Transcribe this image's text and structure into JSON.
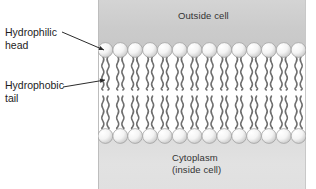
{
  "diagram": {
    "type": "cell-membrane-cross-section",
    "panel": {
      "outside_region_label": "Outside cell",
      "inside_region_label": "Cytoplasm\n(inside cell)",
      "outside_fill": "#cccccc",
      "inside_fill": "#e0e0e0",
      "core_fill": "#ffffff"
    },
    "callouts": [
      {
        "id": "hydrophilic-head",
        "text": "Hydrophilic\nhead",
        "leader_from": [
          62,
          32
        ],
        "leader_to": [
          104,
          50
        ],
        "has_arrowhead": true
      },
      {
        "id": "hydrophobic-tail",
        "text": "Hydrophobic\ntail",
        "leader_from": [
          63,
          87
        ],
        "leader_to": [
          105,
          80
        ],
        "has_arrowhead": true
      }
    ],
    "bilayer": {
      "head_count_per_row": 14,
      "rows": 2,
      "tails_per_head": 2,
      "head_fill": "#f2f2f2",
      "head_stroke": "#9a9a9a",
      "tail_stroke": "#6e6e6e",
      "head_radius_px": 7.4,
      "upper_head_center_y": 10,
      "lower_head_center_y": 96,
      "tail_top_y": 18,
      "tail_bottom_y": 88
    }
  }
}
